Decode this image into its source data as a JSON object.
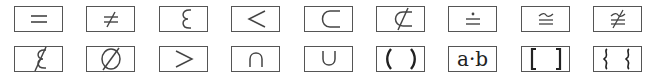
{
  "palette": {
    "rows": [
      [
        {
          "id": "equals",
          "symbol": "=",
          "icon": "equals-icon"
        },
        {
          "id": "not-equals",
          "symbol": "≠",
          "icon": "not-equal-icon"
        },
        {
          "id": "element-of",
          "symbol": "∈",
          "icon": "element-of-icon"
        },
        {
          "id": "less-than",
          "symbol": "<",
          "icon": "less-than-icon"
        },
        {
          "id": "subset",
          "symbol": "⊂",
          "icon": "subset-icon"
        },
        {
          "id": "not-subset",
          "symbol": "⊄",
          "icon": "not-subset-icon"
        },
        {
          "id": "approaches-limit",
          "symbol": "≐",
          "icon": "dot-equal-icon"
        },
        {
          "id": "congruent",
          "symbol": "≅",
          "icon": "congruent-icon"
        },
        {
          "id": "not-congruent",
          "symbol": "≇",
          "icon": "not-congruent-icon"
        }
      ],
      [
        {
          "id": "not-element-of",
          "symbol": "∉",
          "icon": "not-element-of-icon"
        },
        {
          "id": "empty-set",
          "symbol": "∅",
          "icon": "empty-set-icon"
        },
        {
          "id": "greater-than",
          "symbol": ">",
          "icon": "greater-than-icon"
        },
        {
          "id": "intersection",
          "symbol": "∩",
          "icon": "intersection-icon"
        },
        {
          "id": "union",
          "symbol": "∪",
          "icon": "union-icon"
        },
        {
          "id": "parentheses",
          "symbol": "( )",
          "icon": "parentheses-icon"
        },
        {
          "id": "dot-product",
          "symbol": "a·b",
          "icon": "dot-product-icon"
        },
        {
          "id": "brackets",
          "symbol": "[ ]",
          "icon": "brackets-icon"
        },
        {
          "id": "braces",
          "symbol": "{ }",
          "icon": "braces-icon"
        }
      ]
    ]
  }
}
